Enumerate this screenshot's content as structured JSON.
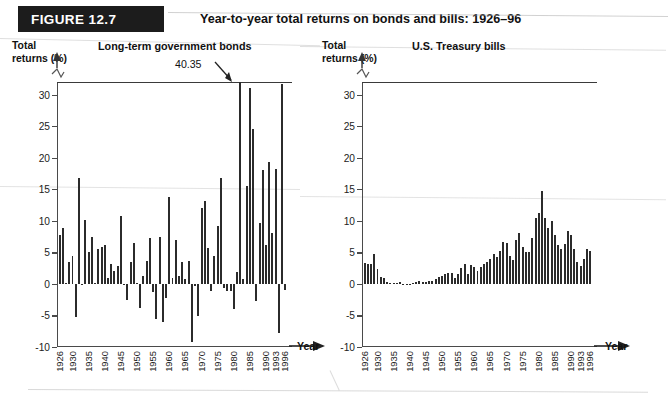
{
  "figure": {
    "badge": "FIGURE 12.7",
    "title": "Year-to-year total returns on bonds and bills: 1926–96"
  },
  "panels": {
    "bonds": {
      "name": "Long-term government bonds",
      "y_axis_title": "Total\nreturns (%)",
      "x_axis_title": "Year",
      "annotation": "40.35"
    },
    "bills": {
      "name": "U.S. Treasury bills",
      "y_axis_title": "Total\nreturns (%)",
      "x_axis_title": "Year"
    }
  },
  "colors": {
    "bar": "#2b2b2b",
    "axis": "#4a4a4a",
    "banner": "#1c1c1c",
    "banner_text": "#ffffff"
  },
  "chart_data": [
    {
      "type": "bar",
      "title": "Long-term government bonds",
      "xlabel": "Year",
      "ylabel": "Total returns (%)",
      "ylim": [
        -10,
        32
      ],
      "yticks": [
        -10,
        -5,
        0,
        5,
        10,
        15,
        20,
        25,
        30
      ],
      "axis_break": true,
      "axis_break_note": "y-axis truncated above 30; 1982 bar clipped, labeled 40.35",
      "grid": false,
      "legend": null,
      "xtick_labels": [
        "1926",
        "1930",
        "1935",
        "1940",
        "1945",
        "1950",
        "1955",
        "1960",
        "1965",
        "1970",
        "1975",
        "1980",
        "1985",
        "1990",
        "1993",
        "1996"
      ],
      "xtick_years": [
        1926,
        1930,
        1935,
        1940,
        1945,
        1950,
        1955,
        1960,
        1965,
        1970,
        1975,
        1980,
        1985,
        1990,
        1993,
        1996
      ],
      "annotations": [
        {
          "text": "40.35",
          "year": 1982,
          "value": 40.35
        }
      ],
      "x": [
        1926,
        1927,
        1928,
        1929,
        1930,
        1931,
        1932,
        1933,
        1934,
        1935,
        1936,
        1937,
        1938,
        1939,
        1940,
        1941,
        1942,
        1943,
        1944,
        1945,
        1946,
        1947,
        1948,
        1949,
        1950,
        1951,
        1952,
        1953,
        1954,
        1955,
        1956,
        1957,
        1958,
        1959,
        1960,
        1961,
        1962,
        1963,
        1964,
        1965,
        1966,
        1967,
        1968,
        1969,
        1970,
        1971,
        1972,
        1973,
        1974,
        1975,
        1976,
        1977,
        1978,
        1979,
        1980,
        1981,
        1982,
        1983,
        1984,
        1985,
        1986,
        1987,
        1988,
        1989,
        1990,
        1991,
        1992,
        1993,
        1994,
        1995,
        1996
      ],
      "values": [
        7.8,
        8.9,
        0.1,
        3.4,
        4.5,
        -5.3,
        16.8,
        -0.1,
        10.1,
        5.0,
        7.5,
        0.2,
        5.5,
        5.9,
        6.1,
        0.9,
        3.2,
        2.1,
        2.8,
        10.7,
        -0.1,
        -2.6,
        3.4,
        6.5,
        0.1,
        -3.9,
        1.2,
        3.6,
        7.2,
        -1.3,
        -5.6,
        7.5,
        -6.1,
        -2.3,
        13.8,
        1.0,
        6.9,
        1.2,
        3.5,
        0.7,
        3.6,
        -9.2,
        -0.3,
        -5.1,
        12.1,
        13.2,
        5.7,
        -1.1,
        4.4,
        9.2,
        16.8,
        -0.7,
        -1.2,
        -1.2,
        -4.0,
        1.9,
        40.35,
        0.7,
        15.5,
        31.0,
        24.5,
        -2.7,
        9.7,
        18.1,
        6.2,
        19.3,
        8.1,
        18.2,
        -7.8,
        31.7,
        -0.9
      ],
      "values_note": "Approximate year-by-year total returns (%) read from the bar heights"
    },
    {
      "type": "bar",
      "title": "U.S. Treasury bills",
      "xlabel": "Year",
      "ylabel": "Total returns (%)",
      "ylim": [
        -10,
        32
      ],
      "yticks": [
        -10,
        -5,
        0,
        5,
        10,
        15,
        20,
        25,
        30
      ],
      "axis_break": true,
      "grid": false,
      "legend": null,
      "xtick_labels": [
        "1926",
        "1930",
        "1935",
        "1940",
        "1945",
        "1950",
        "1955",
        "1960",
        "1965",
        "1970",
        "1975",
        "1980",
        "1985",
        "1990",
        "1993",
        "1996"
      ],
      "xtick_years": [
        1926,
        1930,
        1935,
        1940,
        1945,
        1950,
        1955,
        1960,
        1965,
        1970,
        1975,
        1980,
        1985,
        1990,
        1993,
        1996
      ],
      "annotations": [],
      "x": [
        1926,
        1927,
        1928,
        1929,
        1930,
        1931,
        1932,
        1933,
        1934,
        1935,
        1936,
        1937,
        1938,
        1939,
        1940,
        1941,
        1942,
        1943,
        1944,
        1945,
        1946,
        1947,
        1948,
        1949,
        1950,
        1951,
        1952,
        1953,
        1954,
        1955,
        1956,
        1957,
        1958,
        1959,
        1960,
        1961,
        1962,
        1963,
        1964,
        1965,
        1966,
        1967,
        1968,
        1969,
        1970,
        1971,
        1972,
        1973,
        1974,
        1975,
        1976,
        1977,
        1978,
        1979,
        1980,
        1981,
        1982,
        1983,
        1984,
        1985,
        1986,
        1987,
        1988,
        1989,
        1990,
        1991,
        1992,
        1993,
        1994,
        1995,
        1996
      ],
      "values": [
        3.3,
        3.1,
        3.2,
        4.7,
        2.4,
        1.1,
        1.0,
        0.3,
        0.2,
        0.2,
        0.2,
        0.3,
        0.0,
        0.0,
        0.0,
        0.1,
        0.3,
        0.4,
        0.3,
        0.3,
        0.4,
        0.5,
        0.8,
        1.1,
        1.2,
        1.5,
        1.7,
        1.8,
        0.9,
        1.6,
        2.5,
        3.1,
        1.5,
        3.0,
        2.7,
        2.1,
        2.7,
        3.1,
        3.5,
        3.9,
        4.8,
        4.2,
        5.2,
        6.6,
        6.5,
        4.4,
        3.8,
        6.9,
        8.0,
        5.8,
        5.1,
        5.1,
        7.2,
        10.4,
        11.2,
        14.7,
        10.5,
        8.8,
        9.9,
        7.7,
        6.2,
        5.5,
        6.4,
        8.4,
        7.8,
        5.6,
        3.5,
        2.9,
        3.9,
        5.6,
        5.2
      ],
      "values_note": "Approximate year-by-year total returns (%) read from the bar heights"
    }
  ]
}
